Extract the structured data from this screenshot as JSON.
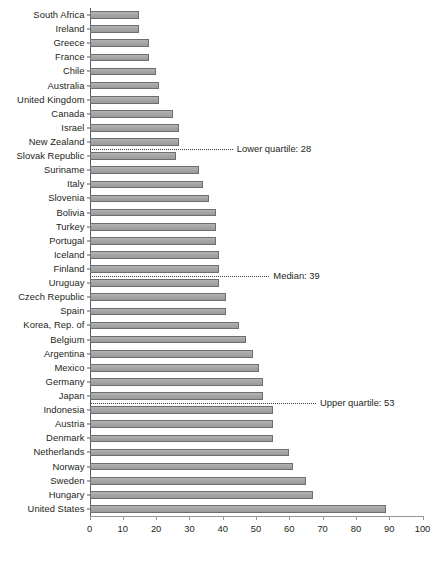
{
  "chart_data": {
    "type": "bar",
    "orientation": "horizontal",
    "title": "",
    "xlabel": "",
    "ylabel": "",
    "xlim": [
      0,
      100
    ],
    "xticks": [
      0,
      10,
      20,
      30,
      40,
      50,
      60,
      70,
      80,
      90,
      100
    ],
    "grid": false,
    "legend": null,
    "categories": [
      "South Africa",
      "Ireland",
      "Greece",
      "France",
      "Chile",
      "Australia",
      "United Kingdom",
      "Canada",
      "Israel",
      "New Zealand",
      "Slovak Republic",
      "Suriname",
      "Italy",
      "Slovenia",
      "Bolivia",
      "Turkey",
      "Portugal",
      "Iceland",
      "Finland",
      "Uruguay",
      "Czech Republic",
      "Spain",
      "Korea, Rep. of",
      "Belgium",
      "Argentina",
      "Mexico",
      "Germany",
      "Japan",
      "Indonesia",
      "Austria",
      "Denmark",
      "Netherlands",
      "Norway",
      "Sweden",
      "Hungary",
      "United States"
    ],
    "values": [
      15,
      15,
      18,
      18,
      20,
      21,
      21,
      25,
      27,
      27,
      26,
      33,
      34,
      36,
      38,
      38,
      38,
      39,
      39,
      39,
      41,
      41,
      45,
      47,
      49,
      51,
      52,
      52,
      55,
      55,
      55,
      60,
      61,
      65,
      67,
      89
    ],
    "annotations": [
      {
        "name": "lower-quartile",
        "label": "Lower quartile: 28",
        "value": 28,
        "row_index": 9
      },
      {
        "name": "median",
        "label": "Median: 39",
        "value": 39,
        "row_index": 18
      },
      {
        "name": "upper-quartile",
        "label": "Upper quartile: 53",
        "value": 53,
        "row_index": 27
      }
    ],
    "colors": {
      "bar_fill": "#a6a6a6",
      "bar_border": "#6d6e71",
      "axis": "#58595b",
      "text": "#231f20",
      "annotation_line": "#3b3b3b"
    }
  }
}
